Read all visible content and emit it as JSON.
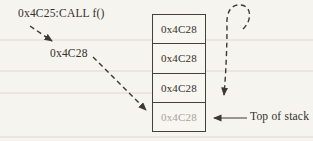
{
  "diagram": {
    "call_label": "0x4C25:CALL f()",
    "return_label": "0x4C28",
    "top_of_stack_label": "Top of stack",
    "stack_cells": [
      "0x4C28",
      "0x4C28",
      "0x4C28",
      "0x4C28"
    ],
    "top_of_stack_cell_index": 3,
    "colors": {
      "line": "#3c3832",
      "text": "#332f2b",
      "muted_text": "#a7a29b",
      "background": "#f6f4ef"
    }
  }
}
